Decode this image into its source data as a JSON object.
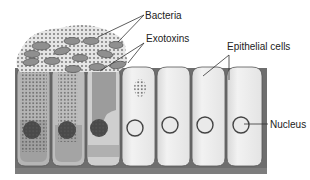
{
  "diagram": {
    "labels": {
      "bacteria": "Bacteria",
      "exotoxins": "Exotoxins",
      "epithelial_cells": "Epithelial cells",
      "nucleus": "Nucleus"
    },
    "cells": {
      "count": 7,
      "affected": [
        1,
        2,
        3
      ],
      "partially_affected": [
        4
      ],
      "healthy": [
        5,
        6,
        7
      ]
    },
    "colors": {
      "cell_fill": "#ececec",
      "cell_outline": "#555555",
      "cell_shadow": "#8a8a8a",
      "affected_fill": "#a8a8a8",
      "bacteria_fill": "#8f8f8f",
      "toxin_dots": "#6a6a6a",
      "nucleus_damaged": "#4a4a4a",
      "nucleus_healthy": "#e8e8e8",
      "text": "#222222"
    }
  }
}
